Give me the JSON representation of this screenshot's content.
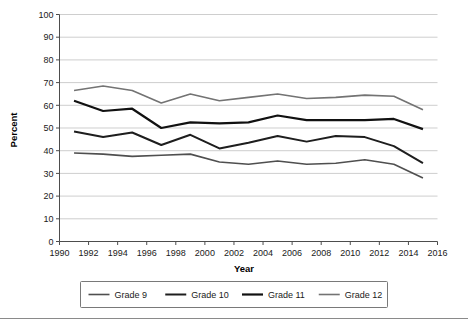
{
  "chart_data": {
    "type": "line",
    "title": "",
    "xlabel": "Year",
    "ylabel": "Percent",
    "xlim": [
      1990,
      2016
    ],
    "ylim": [
      0,
      100
    ],
    "grid": true,
    "legend_position": "bottom",
    "x_ticks": [
      1990,
      1992,
      1994,
      1996,
      1998,
      2000,
      2002,
      2004,
      2006,
      2008,
      2010,
      2012,
      2014,
      2016
    ],
    "y_ticks": [
      0,
      10,
      20,
      30,
      40,
      50,
      60,
      70,
      80,
      90,
      100
    ],
    "x": [
      1991,
      1993,
      1995,
      1997,
      1999,
      2001,
      2003,
      2005,
      2007,
      2009,
      2011,
      2013,
      2015
    ],
    "series": [
      {
        "name": "Grade 9",
        "color": "#4f4f4f",
        "width": 1.6,
        "values": [
          39,
          38.5,
          37.5,
          38,
          38.5,
          35,
          34,
          35.5,
          34,
          34.5,
          36,
          34,
          28
        ]
      },
      {
        "name": "Grade 10",
        "color": "#1e1e1e",
        "width": 2.0,
        "values": [
          48.5,
          46,
          48,
          42.5,
          47,
          41,
          43.5,
          46.5,
          44,
          46.5,
          46,
          42,
          34.5
        ]
      },
      {
        "name": "Grade 11",
        "color": "#111111",
        "width": 2.2,
        "values": [
          62,
          57.5,
          58.5,
          50,
          52.5,
          52,
          52.5,
          55.5,
          53.5,
          53.5,
          53.5,
          54,
          49.5
        ]
      },
      {
        "name": "Grade 12",
        "color": "#737373",
        "width": 1.6,
        "values": [
          66.5,
          68.5,
          66.5,
          61,
          65,
          62,
          63.5,
          65,
          63,
          63.5,
          64.5,
          64,
          58
        ]
      }
    ]
  },
  "legend": {
    "items": [
      {
        "label": "Grade 9"
      },
      {
        "label": "Grade 10"
      },
      {
        "label": "Grade 11"
      },
      {
        "label": "Grade 12"
      }
    ]
  },
  "axes": {
    "x_title": "Year",
    "y_title": "Percent"
  }
}
